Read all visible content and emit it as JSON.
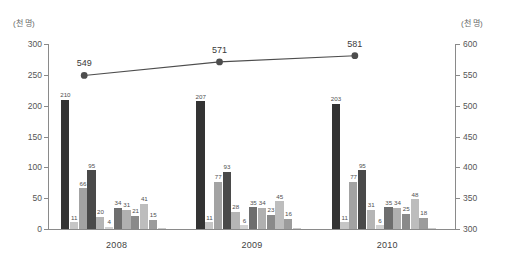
{
  "chart_data": {
    "type": "bar",
    "title": "",
    "subtitle": "",
    "xlabel": "",
    "ylabel": "(천 명)",
    "y2label": "(천 명)",
    "categories": [
      "2008",
      "2009",
      "2010"
    ],
    "ylim": [
      0,
      300
    ],
    "y2lim": [
      300,
      600
    ],
    "yticks": [
      "0",
      "50",
      "100",
      "150",
      "200",
      "250",
      "300"
    ],
    "y2ticks": [
      "300",
      "350",
      "400",
      "450",
      "500",
      "550",
      "600"
    ],
    "grid": false,
    "legend": "none",
    "series": [
      {
        "name": "series-1",
        "axis": "left",
        "color": "#333333",
        "values": [
          210,
          207,
          203
        ]
      },
      {
        "name": "series-2",
        "axis": "left",
        "color": "#c6c6c6",
        "values": [
          11,
          11,
          11
        ]
      },
      {
        "name": "series-3",
        "axis": "left",
        "color": "#a3a3a3",
        "values": [
          66,
          77,
          77
        ]
      },
      {
        "name": "series-4",
        "axis": "left",
        "color": "#4a4a4a",
        "values": [
          95,
          93,
          95
        ]
      },
      {
        "name": "series-5",
        "axis": "left",
        "color": "#b5b5b5",
        "values": [
          20,
          28,
          31
        ]
      },
      {
        "name": "series-6",
        "axis": "left",
        "color": "#d2d2d2",
        "values": [
          4,
          6,
          6
        ]
      },
      {
        "name": "series-7",
        "axis": "left",
        "color": "#6e6e6e",
        "values": [
          34,
          35,
          35
        ]
      },
      {
        "name": "series-8",
        "axis": "left",
        "color": "#b0b0b0",
        "values": [
          31,
          34,
          34
        ]
      },
      {
        "name": "series-9",
        "axis": "left",
        "color": "#8a8a8a",
        "values": [
          21,
          23,
          25
        ]
      },
      {
        "name": "series-10",
        "axis": "left",
        "color": "#bdbdbd",
        "values": [
          41,
          45,
          48
        ]
      },
      {
        "name": "series-11",
        "axis": "left",
        "color": "#9c9c9c",
        "values": [
          15,
          16,
          18
        ]
      },
      {
        "name": "series-12",
        "axis": "left",
        "color": "#cccccc",
        "values": [
          1,
          1,
          1
        ]
      }
    ],
    "line_series": {
      "name": "total-line",
      "axis": "right",
      "color": "#4d4d4d",
      "marker": "circle",
      "values": [
        549,
        571,
        581
      ],
      "labels": [
        "549",
        "571",
        "581"
      ]
    }
  }
}
